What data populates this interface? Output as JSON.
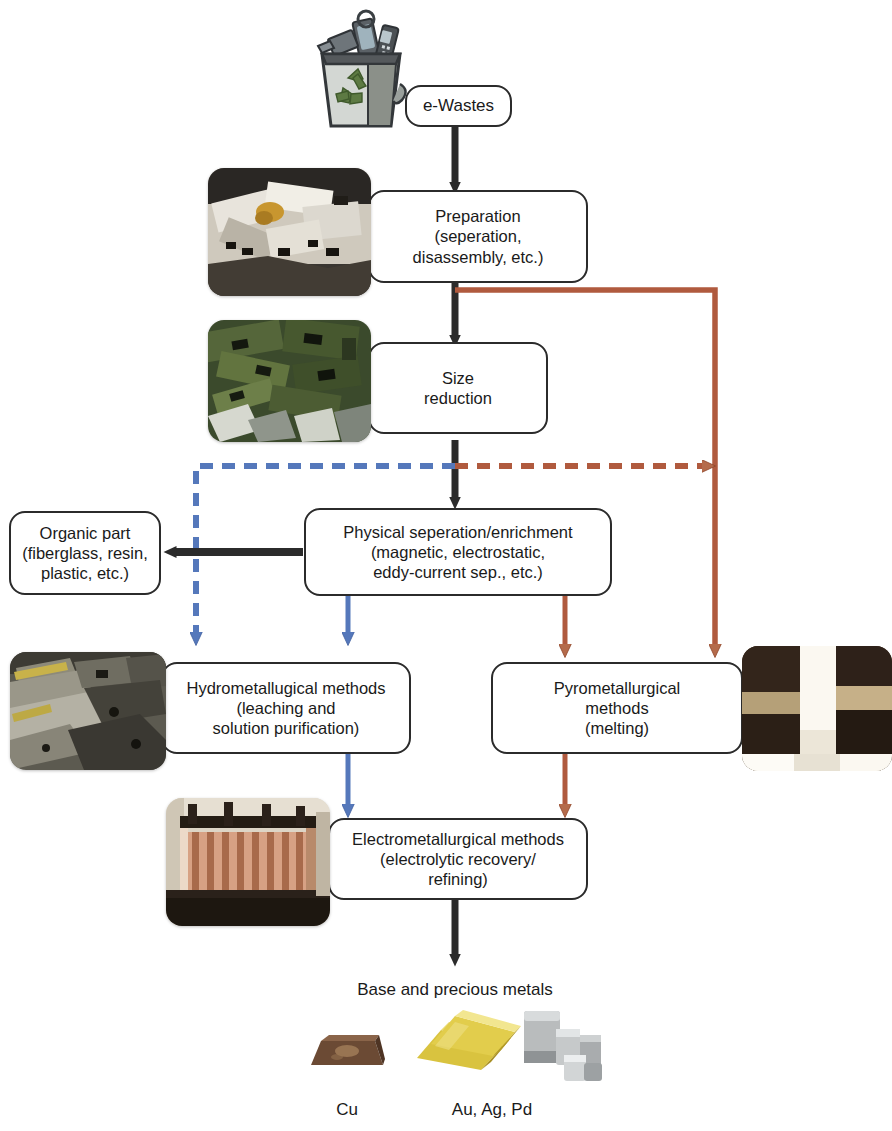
{
  "diagram": {
    "colors": {
      "outline": "#2b2b2b",
      "hydro_blue": "#5578bb",
      "pyro_red": "#b05a3e",
      "text": "#1a1a1a",
      "background": "#ffffff"
    }
  },
  "nodes": {
    "ewastes": {
      "label": "e-Wastes"
    },
    "preparation": {
      "label": "Preparation\n(seperation,\ndisassembly, etc.)"
    },
    "size_reduction": {
      "label": "Size\nreduction"
    },
    "organic_part": {
      "label": "Organic part\n(fiberglass, resin,\nplastic, etc.)"
    },
    "physical_separation": {
      "label": "Physical seperation/enrichment\n(magnetic, electrostatic,\neddy-current sep., etc.)"
    },
    "hydrometallurgical": {
      "label": "Hydrometallugical methods\n(leaching and\nsolution purification)"
    },
    "pyrometallurgical": {
      "label": "Pyrometallurgical\nmethods\n(melting)"
    },
    "electrometallurgical": {
      "label": "Electrometallurgical methods\n(electrolytic recovery/\nrefining)"
    }
  },
  "output": {
    "heading": "Base and precious metals",
    "products": [
      {
        "label": "Cu",
        "icon": "copper-ingot-icon"
      },
      {
        "label": "Au, Ag, Pd",
        "icon": "gold-bars-icon"
      },
      {
        "label": "",
        "icon": "silver-nuggets-icon"
      }
    ]
  },
  "photos": {
    "ewaste_bin": {
      "icon": "ewaste-recycling-bin-icon"
    },
    "preparation": {
      "icon": "disassembled-electronics-photo"
    },
    "size_reduction": {
      "icon": "shredded-circuit-boards-photo"
    },
    "hydrometallurgical": {
      "icon": "leaching-plant-photo"
    },
    "pyrometallurgical": {
      "icon": "molten-furnace-photo"
    },
    "electrometallurgical": {
      "icon": "electrolytic-cells-photo"
    }
  },
  "edges": [
    {
      "name": "ewastes-to-preparation",
      "style": "solid",
      "color": "#2b2b2b"
    },
    {
      "name": "preparation-to-size-reduction",
      "style": "solid",
      "color": "#2b2b2b"
    },
    {
      "name": "preparation-to-pyrometallurgical",
      "style": "solid",
      "color": "#b05a3e"
    },
    {
      "name": "size-reduction-to-physical-separation",
      "style": "solid",
      "color": "#2b2b2b"
    },
    {
      "name": "physical-separation-to-organic-part",
      "style": "solid",
      "color": "#2b2b2b"
    },
    {
      "name": "physical-separation-to-hydrometallurgical",
      "style": "solid",
      "color": "#5578bb"
    },
    {
      "name": "physical-separation-to-pyrometallurgical",
      "style": "solid",
      "color": "#b05a3e"
    },
    {
      "name": "bypass-to-hydrometallurgical",
      "style": "dashed",
      "color": "#5578bb"
    },
    {
      "name": "bypass-to-pyrometallurgical",
      "style": "dashed",
      "color": "#b05a3e"
    },
    {
      "name": "hydrometallurgical-to-electrometallurgical",
      "style": "solid",
      "color": "#5578bb"
    },
    {
      "name": "pyrometallurgical-to-electrometallurgical",
      "style": "solid",
      "color": "#b05a3e"
    },
    {
      "name": "electrometallurgical-to-output",
      "style": "solid",
      "color": "#2b2b2b"
    }
  ]
}
